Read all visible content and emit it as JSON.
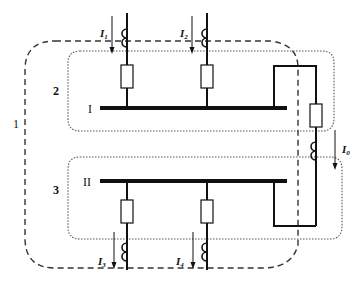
{
  "diagram": {
    "type": "busbar differential protection zones",
    "zone_labels": {
      "zone1": "1",
      "zone2": "2",
      "zone3": "3"
    },
    "buses": {
      "bus1": "I",
      "bus2": "II"
    },
    "currents": {
      "i1": {
        "base": "I",
        "sub": "1"
      },
      "i2": {
        "base": "I",
        "sub": "2"
      },
      "i3": {
        "base": "I",
        "sub": "3"
      },
      "i4": {
        "base": "I",
        "sub": "4"
      },
      "i0": {
        "base": "I",
        "sub": "0"
      }
    },
    "colors": {
      "line": "#111111",
      "zone_dashed": "#333333",
      "zone_dotted": "#555555",
      "background": "#ffffff"
    }
  }
}
